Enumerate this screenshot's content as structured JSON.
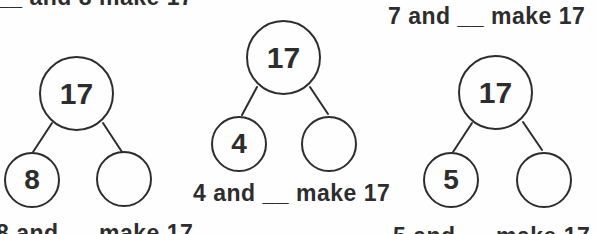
{
  "page": {
    "background_color": "#fefefe",
    "ink_color": "#2d2d2d",
    "total_number": "17"
  },
  "captions": {
    "top_left_partial": "__ and 8 make 17",
    "top_right": "7 and __ make 17",
    "middle": "4 and __ make 17",
    "bottom_left_partial": "8 and __ make 17",
    "bottom_right_partial": "5 and __ make 17"
  },
  "trees": [
    {
      "parent": "17",
      "left_child": "8",
      "right_child": ""
    },
    {
      "parent": "17",
      "left_child": "4",
      "right_child": ""
    },
    {
      "parent": "17",
      "left_child": "5",
      "right_child": ""
    }
  ]
}
